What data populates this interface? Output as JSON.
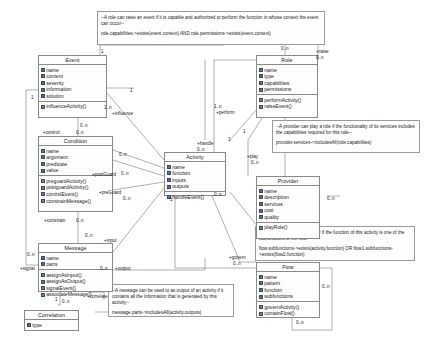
{
  "diagram": {
    "classes": [
      {
        "id": "event",
        "name": "Event",
        "attributes": [
          "name",
          "content",
          "severity",
          "information",
          "solution"
        ],
        "operations": [
          "influenceActivity()"
        ]
      },
      {
        "id": "condition",
        "name": "Condition",
        "attributes": [
          "name",
          "argument",
          "predicate",
          "value"
        ],
        "operations": [
          "preguardActivity()",
          "postguardActivity()",
          "controlEvent()",
          "constrainMessage()"
        ]
      },
      {
        "id": "message",
        "name": "Message",
        "attributes": [
          "name",
          "parts"
        ],
        "operations": [
          "assignAsInput()",
          "assignAsOutput()",
          "signalEvent()",
          "associateMessage()"
        ]
      },
      {
        "id": "correlation",
        "name": "Correlation",
        "attributes": [
          "type"
        ],
        "operations": []
      },
      {
        "id": "activity",
        "name": "Activity",
        "attributes": [
          "name",
          "function",
          "inputs",
          "outputs"
        ],
        "operations": [
          "handleEvent()"
        ]
      },
      {
        "id": "role",
        "name": "Role",
        "attributes": [
          "name",
          "type",
          "capabilities",
          "permissions"
        ],
        "operations": [
          "performActivity()",
          "raiseEvent()"
        ]
      },
      {
        "id": "provider",
        "name": "Provider",
        "attributes": [
          "name",
          "description",
          "services",
          "cost",
          "quality"
        ],
        "operations": [
          "playRole()"
        ]
      },
      {
        "id": "flow",
        "name": "Flow",
        "attributes": [
          "name",
          "pattern",
          "function",
          "subfunctions"
        ],
        "operations": [
          "governActivity()",
          "containFlow()"
        ]
      }
    ],
    "notes": [
      {
        "id": "note-role-raise",
        "text": "--A role can raise an event if it is capable and authorized to perform the function in whose context the event can occur--",
        "ocl": "role.capabilities->exists(event.context) AND role.permissions->exists(event.context)"
      },
      {
        "id": "note-provider-play",
        "text": "--A provider can play a role if the functionality of its services includes the capabilities required for this role--",
        "ocl": "provider.services->includesAll(role.capabilities)"
      },
      {
        "id": "note-flow-include",
        "text": "--A flow can include an activity if the function of this activity is one of the subfunctions of the flow--",
        "ocl": "flow.subfunctions->exists(activity.function) OR flow1.subfunctions->exists(flow2.function)"
      },
      {
        "id": "note-message-output",
        "text": "--A message can be used to as output of an activity if it contains all the information that is generated by this activity--",
        "ocl": "message.parts->includesAll(activity.outputs)"
      }
    ],
    "associations": [
      {
        "id": "assoc-influence",
        "role_label": "+influence",
        "mult_a": "1..n",
        "mult_b": "0..n"
      },
      {
        "id": "assoc-control",
        "role_label": "+control",
        "mult_a": "0..n",
        "mult_b": "0..n"
      },
      {
        "id": "assoc-postguard",
        "role_label": "+postGuard",
        "mult_a": "0..n",
        "mult_b": "0..n"
      },
      {
        "id": "assoc-preguard",
        "role_label": "+preGuard",
        "mult_a": "0..n",
        "mult_b": "0..n"
      },
      {
        "id": "assoc-constrain",
        "role_label": "+constrain",
        "mult_a": "0..n",
        "mult_b": "0..n"
      },
      {
        "id": "assoc-input",
        "role_label": "+input",
        "mult_a": "0..n",
        "mult_b": "0..n"
      },
      {
        "id": "assoc-output",
        "role_label": "+output",
        "mult_a": "0..n",
        "mult_b": "0..n"
      },
      {
        "id": "assoc-signal",
        "role_label": "+signal",
        "mult_a": "0..n",
        "mult_b": "0..n"
      },
      {
        "id": "assoc-correlate",
        "role_label": "+correlate",
        "mult_a": "0..n",
        "mult_b": "0..n"
      },
      {
        "id": "assoc-handle",
        "role_label": "+handle",
        "mult_a": "0..n",
        "mult_b": "0..n"
      },
      {
        "id": "assoc-perform",
        "role_label": "+perform",
        "mult_a": "1..n",
        "mult_b": "0..n"
      },
      {
        "id": "assoc-raise",
        "role_label": "+raise",
        "mult_a": "0..n",
        "mult_b": "1"
      },
      {
        "id": "assoc-play",
        "role_label": "+play",
        "mult_a": "0..n",
        "mult_b": "0..n"
      },
      {
        "id": "assoc-govern",
        "role_label": "+govern",
        "mult_a": "0..n",
        "mult_b": "0..n"
      },
      {
        "id": "assoc-contain",
        "role_label": "+contain",
        "mult_a": "0..n",
        "mult_b": "0..n"
      }
    ],
    "labels": [
      {
        "id": "l-event-top-1",
        "text": "1",
        "x": 101,
        "y": 49
      },
      {
        "id": "l-event-r-1",
        "text": "1",
        "x": 130,
        "y": 88
      },
      {
        "id": "l-event-bl-1",
        "text": "1",
        "x": 31,
        "y": 95
      },
      {
        "id": "l-influence-m",
        "text": "1..n",
        "x": 104,
        "y": 105
      },
      {
        "id": "l-influence-lb",
        "text": "+influence",
        "x": 112,
        "y": 111
      },
      {
        "id": "l-event-bot",
        "text": "0..n",
        "x": 80,
        "y": 123
      },
      {
        "id": "l-control-lb",
        "text": "+control",
        "x": 43,
        "y": 130
      },
      {
        "id": "l-control-m",
        "text": "0..n",
        "x": 76,
        "y": 130
      },
      {
        "id": "l-cond-r1",
        "text": "0..n",
        "x": 119,
        "y": 152
      },
      {
        "id": "l-postguard-m",
        "text": "0..n",
        "x": 121,
        "y": 171
      },
      {
        "id": "l-postguard-lb",
        "text": "+postGuard",
        "x": 92,
        "y": 172
      },
      {
        "id": "l-preguard-lb",
        "text": "+preGuard",
        "x": 99,
        "y": 190
      },
      {
        "id": "l-preguard-m",
        "text": "0..n",
        "x": 123,
        "y": 196
      },
      {
        "id": "l-constrain-lb",
        "text": "+constrain",
        "x": 44,
        "y": 218
      },
      {
        "id": "l-constrain-m",
        "text": "0..n",
        "x": 76,
        "y": 218
      },
      {
        "id": "l-msg-in-lb",
        "text": "+input",
        "x": 104,
        "y": 238
      },
      {
        "id": "l-msg-in-m",
        "text": "0..n",
        "x": 85,
        "y": 233
      },
      {
        "id": "l-msg-out-m",
        "text": "0..n",
        "x": 100,
        "y": 266
      },
      {
        "id": "l-msg-out-lb",
        "text": "+output",
        "x": 115,
        "y": 266
      },
      {
        "id": "l-signal-lb",
        "text": "+signal",
        "x": 20,
        "y": 266
      },
      {
        "id": "l-signal-m",
        "text": "0..n",
        "x": 27,
        "y": 252
      },
      {
        "id": "l-correlate-lb",
        "text": "+correlate",
        "x": 87,
        "y": 294
      },
      {
        "id": "l-correlate-m",
        "text": "0..n",
        "x": 62,
        "y": 299
      },
      {
        "id": "l-msg-b1",
        "text": "1",
        "x": 55,
        "y": 297
      },
      {
        "id": "l-handle-lb",
        "text": "+handle",
        "x": 197,
        "y": 141
      },
      {
        "id": "l-handle-m",
        "text": "0..n",
        "x": 197,
        "y": 147
      },
      {
        "id": "l-act-r1",
        "text": "1",
        "x": 228,
        "y": 137
      },
      {
        "id": "l-act-b1",
        "text": "1",
        "x": 170,
        "y": 197
      },
      {
        "id": "l-act-b2",
        "text": "0..n",
        "x": 214,
        "y": 192
      },
      {
        "id": "l-perform-m",
        "text": "1..n",
        "x": 214,
        "y": 104
      },
      {
        "id": "l-perform-lb",
        "text": "+perform",
        "x": 216,
        "y": 110
      },
      {
        "id": "l-raise-lb",
        "text": "+raise",
        "x": 316,
        "y": 49
      },
      {
        "id": "l-raise-m",
        "text": "0..n",
        "x": 316,
        "y": 55
      },
      {
        "id": "l-role-top-m",
        "text": "0..n",
        "x": 281,
        "y": 46
      },
      {
        "id": "l-role-bl",
        "text": "1",
        "x": 243,
        "y": 129
      },
      {
        "id": "l-play-lb",
        "text": "+play",
        "x": 247,
        "y": 154
      },
      {
        "id": "l-play-m",
        "text": "0..n",
        "x": 251,
        "y": 160
      },
      {
        "id": "l-prov-r",
        "text": "0..n",
        "x": 327,
        "y": 196
      },
      {
        "id": "l-govern-lb",
        "text": "+govern",
        "x": 229,
        "y": 255
      },
      {
        "id": "l-govern-m",
        "text": "0..n",
        "x": 233,
        "y": 261
      },
      {
        "id": "l-flow-r-m",
        "text": "0..n",
        "x": 322,
        "y": 284
      },
      {
        "id": "l-flow-contain",
        "text": "0..n",
        "x": 296,
        "y": 320
      }
    ]
  }
}
